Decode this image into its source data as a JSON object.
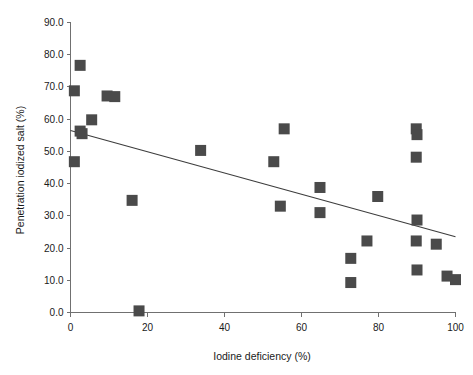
{
  "chart_data": {
    "type": "scatter",
    "title": "",
    "xlabel": "Iodine deficiency (%)",
    "ylabel": "Penetration iodized salt (%)",
    "xlim": [
      0,
      100
    ],
    "ylim": [
      0,
      90
    ],
    "xticks": [
      0,
      20,
      40,
      60,
      80,
      100
    ],
    "xtick_labels": [
      "0",
      "20",
      "40",
      "60",
      "80",
      "100"
    ],
    "yticks": [
      0,
      10,
      20,
      30,
      40,
      50,
      60,
      70,
      80,
      90
    ],
    "ytick_labels": [
      "0.0",
      "10.0",
      "20.0",
      "30.0",
      "40.0",
      "50.0",
      "60.0",
      "70.0",
      "80.0",
      "90.0"
    ],
    "grid": false,
    "legend": null,
    "marker": {
      "shape": "square",
      "color": "#4a4a4a",
      "size_px": 11
    },
    "points": [
      {
        "x": 2.5,
        "y": 76.7
      },
      {
        "x": 1.0,
        "y": 68.8
      },
      {
        "x": 9.5,
        "y": 67.2
      },
      {
        "x": 11.5,
        "y": 67.0
      },
      {
        "x": 5.5,
        "y": 59.8
      },
      {
        "x": 2.5,
        "y": 56.3
      },
      {
        "x": 3.0,
        "y": 55.5
      },
      {
        "x": 1.0,
        "y": 46.8
      },
      {
        "x": 16.0,
        "y": 34.8
      },
      {
        "x": 17.8,
        "y": 0.5
      },
      {
        "x": 33.8,
        "y": 50.3
      },
      {
        "x": 55.5,
        "y": 57.0
      },
      {
        "x": 52.8,
        "y": 46.8
      },
      {
        "x": 54.5,
        "y": 33.0
      },
      {
        "x": 64.8,
        "y": 38.8
      },
      {
        "x": 64.8,
        "y": 31.0
      },
      {
        "x": 72.8,
        "y": 16.8
      },
      {
        "x": 72.8,
        "y": 9.3
      },
      {
        "x": 77.0,
        "y": 22.2
      },
      {
        "x": 79.8,
        "y": 36.0
      },
      {
        "x": 89.8,
        "y": 57.0
      },
      {
        "x": 90.0,
        "y": 55.2
      },
      {
        "x": 89.8,
        "y": 48.2
      },
      {
        "x": 90.0,
        "y": 28.7
      },
      {
        "x": 89.8,
        "y": 22.2
      },
      {
        "x": 90.0,
        "y": 13.2
      },
      {
        "x": 95.0,
        "y": 21.2
      },
      {
        "x": 97.8,
        "y": 11.3
      },
      {
        "x": 100.0,
        "y": 10.2
      }
    ],
    "trendline": {
      "type": "linear",
      "x0": 0,
      "y0": 56.5,
      "x1": 100,
      "y1": 23.5,
      "color": "#3d3d3d"
    }
  },
  "axes": {
    "x_axis_name": "x-axis",
    "y_axis_name": "y-axis"
  }
}
